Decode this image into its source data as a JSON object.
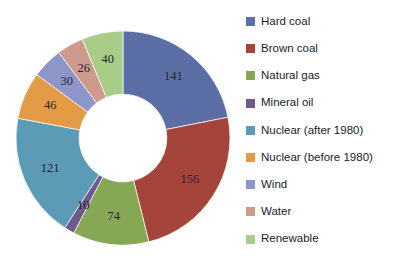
{
  "chart_data": {
    "type": "pie",
    "variant": "donut",
    "title": "",
    "subtitle": "",
    "xlabel": "",
    "ylabel": "",
    "grid": false,
    "legend_position": "right",
    "start_angle_deg": 0,
    "direction": "clockwise",
    "inner_radius_ratio": 0.41,
    "total": 644,
    "categories": [
      "Hard coal",
      "Brown coal",
      "Natural gas",
      "Mineral oil",
      "Nuclear (after 1980)",
      "Nuclear (before 1980)",
      "Wind",
      "Water",
      "Renewable"
    ],
    "values": [
      141,
      156,
      74,
      10,
      121,
      46,
      30,
      26,
      40
    ],
    "data_labels": [
      "141",
      "156",
      "74",
      "10",
      "121",
      "46",
      "30",
      "26",
      "40"
    ],
    "colors": [
      "#5b6ea5",
      "#a5443a",
      "#86a854",
      "#6e5a8c",
      "#5b9bb5",
      "#e39b45",
      "#8e96c8",
      "#cf9a8e",
      "#a8cd88"
    ]
  },
  "legend": {
    "items": [
      {
        "label": "Hard coal",
        "color": "#5b6ea5"
      },
      {
        "label": "Brown coal",
        "color": "#a5443a"
      },
      {
        "label": "Natural gas",
        "color": "#86a854"
      },
      {
        "label": "Mineral oil",
        "color": "#6e5a8c"
      },
      {
        "label": "Nuclear (after 1980)",
        "color": "#5b9bb5"
      },
      {
        "label": "Nuclear (before 1980)",
        "color": "#e39b45"
      },
      {
        "label": "Wind",
        "color": "#8e96c8"
      },
      {
        "label": "Water",
        "color": "#cf9a8e"
      },
      {
        "label": "Renewable",
        "color": "#a8cd88"
      }
    ]
  }
}
